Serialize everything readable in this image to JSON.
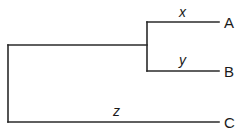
{
  "diagram": {
    "type": "phylogenetic-tree",
    "line_color": "#2a2a2a",
    "taxa": [
      {
        "label": "A"
      },
      {
        "label": "B"
      },
      {
        "label": "C"
      }
    ],
    "branches": [
      {
        "label": "x",
        "leads_to": "A"
      },
      {
        "label": "y",
        "leads_to": "B"
      },
      {
        "label": "z",
        "leads_to": "C"
      }
    ]
  }
}
